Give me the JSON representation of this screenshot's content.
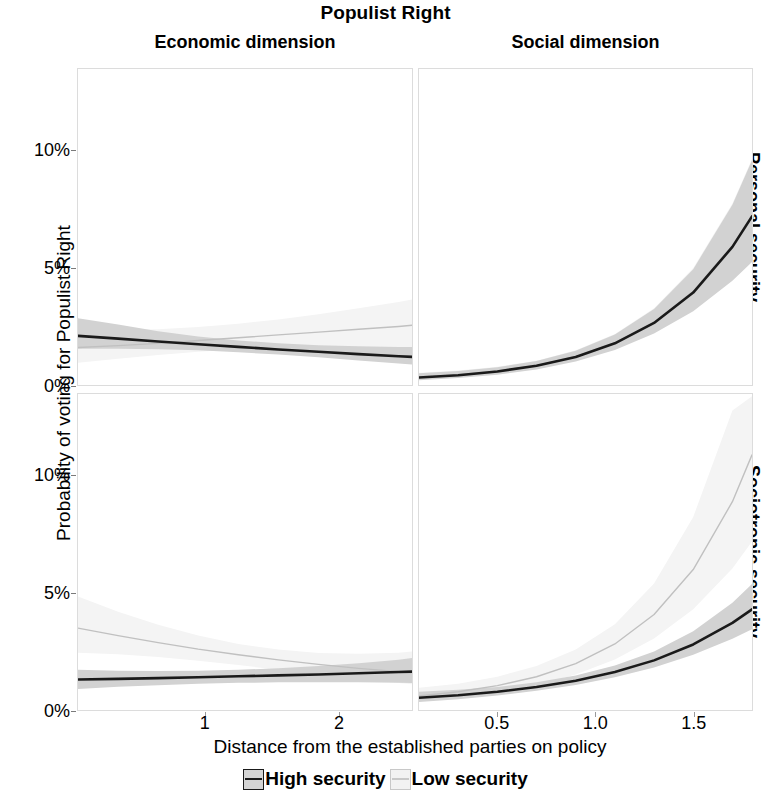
{
  "title": "Populist Right",
  "axes": {
    "x_title": "Distance from the established parties on policy",
    "y_title": "Probability of voting for Populist Right"
  },
  "column_strips": [
    {
      "label": "Economic dimension"
    },
    {
      "label": "Social dimension"
    }
  ],
  "row_strips": [
    {
      "label": "Personal security"
    },
    {
      "label": "Sociotropic security"
    }
  ],
  "legend": {
    "items": [
      {
        "label": "High security",
        "color": "#1a1a1a",
        "band_color": "#d4d4d4"
      },
      {
        "label": "Low security",
        "color": "#c8c8c8",
        "band_color": "#f2f2f2"
      }
    ]
  },
  "colors": {
    "high_line": "#1a1a1a",
    "high_band": "#d2d2d2",
    "low_line": "#c0c0c0",
    "low_band": "#f4f4f4",
    "panel_border": "#dcdcdc",
    "tick": "#8a8a8a",
    "text": "#000000"
  },
  "chart_data": {
    "type": "line",
    "title": "Populist Right",
    "xlabel": "Distance from the established parties on policy",
    "ylabel": "Probability of voting for Populist Right",
    "grid": false,
    "legend_position": "bottom",
    "facet_rows": [
      "Personal security",
      "Sociotropic security"
    ],
    "facet_cols": [
      "Economic dimension",
      "Social dimension"
    ],
    "ylim": [
      0,
      13.5
    ],
    "yticks": [
      0,
      5,
      10
    ],
    "ytick_labels": [
      "0%",
      "5%",
      "10%"
    ],
    "panels": [
      {
        "row": "Personal security",
        "col": "Economic dimension",
        "xlim": [
          0.05,
          2.55
        ],
        "xticks": [
          1,
          2
        ],
        "xtick_labels": [
          "1",
          "2"
        ],
        "series": [
          {
            "name": "High security",
            "x": [
              0.05,
              0.35,
              0.65,
              0.95,
              1.25,
              1.55,
              1.85,
              2.15,
              2.45,
              2.55
            ],
            "y": [
              2.1,
              1.98,
              1.86,
              1.74,
              1.63,
              1.52,
              1.42,
              1.32,
              1.23,
              1.2
            ],
            "ci_lo": [
              1.55,
              1.55,
              1.53,
              1.48,
              1.4,
              1.3,
              1.18,
              1.05,
              0.92,
              0.88
            ],
            "ci_hi": [
              2.85,
              2.58,
              2.3,
              2.07,
              1.9,
              1.78,
              1.7,
              1.65,
              1.62,
              1.62
            ]
          },
          {
            "name": "Low security",
            "x": [
              0.05,
              0.35,
              0.65,
              0.95,
              1.25,
              1.55,
              1.85,
              2.15,
              2.45,
              2.55
            ],
            "y": [
              1.6,
              1.68,
              1.78,
              1.9,
              2.02,
              2.14,
              2.26,
              2.38,
              2.5,
              2.55
            ],
            "ci_lo": [
              0.95,
              1.12,
              1.28,
              1.42,
              1.53,
              1.6,
              1.62,
              1.6,
              1.55,
              1.52
            ],
            "ci_hi": [
              2.4,
              2.35,
              2.38,
              2.48,
              2.62,
              2.8,
              3.02,
              3.28,
              3.55,
              3.65
            ]
          }
        ]
      },
      {
        "row": "Personal security",
        "col": "Social dimension",
        "xlim": [
          0.1,
          1.8
        ],
        "xticks": [
          0.5,
          1.0,
          1.5
        ],
        "xtick_labels": [
          "0.5",
          "1.0",
          "1.5"
        ],
        "series": [
          {
            "name": "High security",
            "x": [
              0.1,
              0.3,
              0.5,
              0.7,
              0.9,
              1.1,
              1.3,
              1.5,
              1.7,
              1.8
            ],
            "y": [
              0.32,
              0.42,
              0.58,
              0.82,
              1.2,
              1.78,
              2.65,
              3.95,
              5.9,
              7.2
            ],
            "ci_lo": [
              0.2,
              0.3,
              0.44,
              0.66,
              1.0,
              1.5,
              2.2,
              3.15,
              4.45,
              5.25
            ],
            "ci_hi": [
              0.5,
              0.6,
              0.76,
              1.02,
              1.46,
              2.16,
              3.25,
              4.95,
              7.7,
              9.6
            ]
          },
          {
            "name": "Low security",
            "x": [
              0.1,
              0.3,
              0.5,
              0.7,
              0.9,
              1.1,
              1.3,
              1.5,
              1.7,
              1.8
            ],
            "y": [
              0.34,
              0.44,
              0.6,
              0.84,
              1.22,
              1.8,
              2.68,
              4.0,
              5.95,
              7.25
            ],
            "ci_lo": [
              0.22,
              0.32,
              0.46,
              0.68,
              1.02,
              1.52,
              2.22,
              3.18,
              4.5,
              5.3
            ],
            "ci_hi": [
              0.52,
              0.62,
              0.78,
              1.04,
              1.48,
              2.18,
              3.28,
              5.0,
              7.75,
              9.65
            ]
          }
        ]
      },
      {
        "row": "Sociotropic security",
        "col": "Economic dimension",
        "xlim": [
          0.05,
          2.55
        ],
        "xticks": [
          1,
          2
        ],
        "xtick_labels": [
          "1",
          "2"
        ],
        "series": [
          {
            "name": "High security",
            "x": [
              0.05,
              0.35,
              0.65,
              0.95,
              1.25,
              1.55,
              1.85,
              2.15,
              2.45,
              2.55
            ],
            "y": [
              1.3,
              1.33,
              1.36,
              1.4,
              1.44,
              1.48,
              1.52,
              1.57,
              1.62,
              1.64
            ],
            "ci_lo": [
              0.9,
              0.99,
              1.06,
              1.12,
              1.16,
              1.18,
              1.19,
              1.18,
              1.16,
              1.15
            ],
            "ci_hi": [
              1.72,
              1.68,
              1.67,
              1.68,
              1.72,
              1.78,
              1.88,
              2.0,
              2.15,
              2.22
            ]
          },
          {
            "name": "Low security",
            "x": [
              0.05,
              0.35,
              0.65,
              0.95,
              1.25,
              1.55,
              1.85,
              2.15,
              2.45,
              2.55
            ],
            "y": [
              3.5,
              3.18,
              2.88,
              2.6,
              2.36,
              2.14,
              1.95,
              1.78,
              1.64,
              1.6
            ],
            "ci_lo": [
              2.45,
              2.38,
              2.26,
              2.1,
              1.92,
              1.72,
              1.52,
              1.32,
              1.15,
              1.1
            ],
            "ci_hi": [
              4.85,
              4.2,
              3.64,
              3.18,
              2.82,
              2.58,
              2.44,
              2.4,
              2.45,
              2.5
            ]
          }
        ]
      },
      {
        "row": "Sociotropic security",
        "col": "Social dimension",
        "xlim": [
          0.1,
          1.8
        ],
        "xticks": [
          0.5,
          1.0,
          1.5
        ],
        "xtick_labels": [
          "0.5",
          "1.0",
          "1.5"
        ],
        "series": [
          {
            "name": "High security",
            "x": [
              0.1,
              0.3,
              0.5,
              0.7,
              0.9,
              1.1,
              1.3,
              1.5,
              1.7,
              1.8
            ],
            "y": [
              0.52,
              0.63,
              0.78,
              0.98,
              1.25,
              1.62,
              2.12,
              2.8,
              3.72,
              4.3
            ],
            "ci_lo": [
              0.34,
              0.46,
              0.62,
              0.82,
              1.07,
              1.4,
              1.82,
              2.36,
              3.04,
              3.45
            ],
            "ci_hi": [
              0.78,
              0.86,
              0.98,
              1.18,
              1.47,
              1.9,
              2.5,
              3.36,
              4.58,
              5.38
            ]
          },
          {
            "name": "Low security",
            "x": [
              0.1,
              0.3,
              0.5,
              0.7,
              0.9,
              1.1,
              1.3,
              1.5,
              1.7,
              1.8
            ],
            "y": [
              0.6,
              0.78,
              1.04,
              1.42,
              1.98,
              2.82,
              4.08,
              6.0,
              8.9,
              10.9
            ],
            "ci_lo": [
              0.36,
              0.52,
              0.74,
              1.06,
              1.52,
              2.16,
              3.05,
              4.3,
              6.05,
              7.2
            ],
            "ci_hi": [
              0.95,
              1.12,
              1.42,
              1.88,
              2.58,
              3.66,
              5.4,
              8.25,
              12.8,
              13.4
            ]
          }
        ]
      }
    ]
  }
}
